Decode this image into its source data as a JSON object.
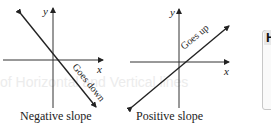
{
  "panels": [
    {
      "id": "negative",
      "caption": "Negative slope",
      "line_label": "Goes down",
      "x_axis_label": "x",
      "y_axis_label": "y"
    },
    {
      "id": "positive",
      "caption": "Positive slope",
      "line_label": "Goes up",
      "x_axis_label": "x",
      "y_axis_label": "y"
    }
  ],
  "side_card": {
    "heading": "H"
  },
  "background_text": "of Horizontal and Vertical lines",
  "colors": {
    "ink": "#222222",
    "background": "#ffffff",
    "card_border": "#c8c8c8"
  }
}
